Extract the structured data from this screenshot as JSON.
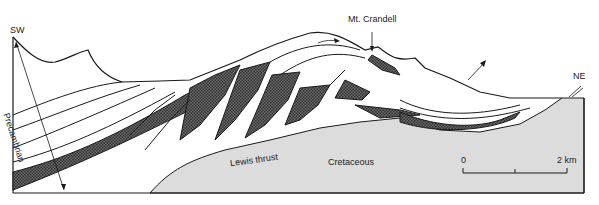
{
  "figure": {
    "type": "geological-cross-section",
    "colors": {
      "background": "#ffffff",
      "cretaceous_fill": "#dcdcdc",
      "shaded_bed": "#555555",
      "line": "#1a1a1a"
    }
  },
  "labels": {
    "sw": "SW",
    "ne": "NE",
    "precambrian": "Precambrian",
    "mt_crandell": "Mt. Crandell",
    "lewis_thrust": "Lewis thrust",
    "cretaceous": "Cretaceous"
  },
  "scale_bar": {
    "start": "0",
    "end": "2 km"
  }
}
